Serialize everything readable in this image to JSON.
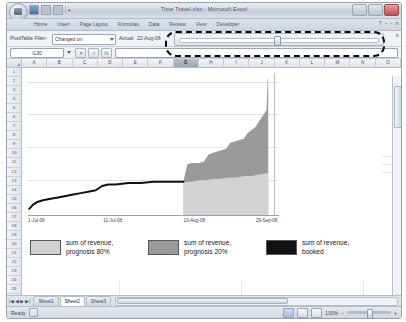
{
  "window": {
    "title": "Time Travel.xlsx - Microsoft Excel",
    "office_button": "office-orb",
    "quick_access": [
      "save-icon",
      "undo-icon",
      "redo-icon",
      "customize-icon"
    ],
    "controls": {
      "minimize": "–",
      "restore": "▫",
      "close": "✕"
    }
  },
  "ribbon": {
    "tabs": [
      {
        "label": "Home",
        "active": false
      },
      {
        "label": "Insert",
        "active": false
      },
      {
        "label": "Page Layout",
        "active": false
      },
      {
        "label": "Formulas",
        "active": false
      },
      {
        "label": "Data",
        "active": false
      },
      {
        "label": "Review",
        "active": false
      },
      {
        "label": "View",
        "active": false
      },
      {
        "label": "Developer",
        "active": false
      }
    ],
    "help": "?",
    "minimize_ribbon": "–",
    "restore_ribbon": "▫",
    "close_doc": "✕"
  },
  "pivot_bar": {
    "filter_label": "PivotTable Filter:",
    "filter_value": "Changed on",
    "actual_label": "Actual:",
    "actual_value": "22-Aug-08",
    "slider_name": "time-travel-slider",
    "close_label": "✕"
  },
  "formula_bar": {
    "name_box": "G30",
    "cancel": "✕",
    "accept": "✓",
    "insert_function": "fx",
    "formula_value": ""
  },
  "grid": {
    "columns": [
      "A",
      "B",
      "C",
      "D",
      "E",
      "F",
      "G",
      "H",
      "I",
      "J",
      "K",
      "L",
      "M",
      "N",
      "O"
    ],
    "selected_column": "G",
    "rows": [
      1,
      2,
      3,
      4,
      5,
      6,
      7,
      8,
      9,
      10,
      11,
      12,
      13,
      14,
      15,
      16,
      17,
      18,
      19,
      20,
      21,
      22,
      23,
      24,
      25,
      26,
      27,
      28
    ]
  },
  "chart_data": {
    "type": "area",
    "title": "",
    "xlabel": "",
    "ylabel": "",
    "grid": true,
    "legend_position": "bottom",
    "xticks": [
      "1-Jul-08",
      "11-Jul-08",
      "10-Aug-08",
      "29-Sep-08"
    ],
    "xtick_positions": [
      0.0,
      0.3,
      0.62,
      0.94
    ],
    "gridline_count": 4,
    "gridline_fractions": [
      0.06,
      0.29,
      0.52,
      0.75
    ],
    "ylim": [
      0,
      100
    ],
    "series": [
      {
        "name": "sum of revenue, prognosis 80%",
        "color": "#d2d2d2",
        "type": "area",
        "x": [
          0.62,
          0.65,
          0.68,
          0.71,
          0.74,
          0.77,
          0.8,
          0.83,
          0.86,
          0.89,
          0.92,
          0.955,
          0.957
        ],
        "values": [
          24,
          24,
          25,
          25,
          26,
          26,
          27,
          27,
          28,
          28,
          29,
          30,
          30
        ]
      },
      {
        "name": "sum of revenue, prognosis 20%",
        "color": "#9a9a9a",
        "type": "area",
        "x": [
          0.62,
          0.635,
          0.65,
          0.68,
          0.7,
          0.72,
          0.735,
          0.75,
          0.77,
          0.79,
          0.805,
          0.82,
          0.84,
          0.86,
          0.875,
          0.89,
          0.905,
          0.92,
          0.935,
          0.95,
          0.955,
          0.957
        ],
        "values": [
          25,
          36,
          37,
          37,
          38,
          43,
          44,
          45,
          46,
          47,
          51,
          52,
          53,
          54,
          58,
          60,
          62,
          66,
          70,
          74,
          96,
          96
        ]
      },
      {
        "name": "sum of revenue, booked",
        "color": "#111111",
        "type": "line",
        "x": [
          0.005,
          0.02,
          0.04,
          0.06,
          0.09,
          0.12,
          0.15,
          0.18,
          0.21,
          0.24,
          0.27,
          0.295,
          0.32,
          0.35,
          0.4,
          0.45,
          0.5,
          0.55,
          0.6,
          0.62
        ],
        "values": [
          5,
          8,
          10,
          11,
          12,
          13,
          14,
          15,
          16,
          17,
          18,
          21,
          22,
          22,
          23,
          23,
          24,
          24,
          24,
          24
        ]
      }
    ],
    "legend_entries": [
      {
        "label_line1": "sum of revenue,",
        "label_line2": "prognosis 80%",
        "color": "#d2d2d2"
      },
      {
        "label_line1": "sum of revenue,",
        "label_line2": "prognosis 20%",
        "color": "#9a9a9a"
      },
      {
        "label_line1": "sum of revenue,",
        "label_line2": "booked",
        "color": "#111111"
      }
    ]
  },
  "sheet_tabs": {
    "nav": [
      "|◀",
      "◀",
      "▶",
      "▶|"
    ],
    "tabs": [
      {
        "label": "Sheet1",
        "active": false
      },
      {
        "label": "Sheet2",
        "active": true
      },
      {
        "label": "Sheet3",
        "active": false
      }
    ],
    "new_sheet": "⊕"
  },
  "status_bar": {
    "status": "Ready",
    "views": [
      "normal-view",
      "page-layout-view",
      "page-break-view"
    ],
    "zoom": "100%",
    "zoom_out": "−",
    "zoom_in": "+"
  }
}
